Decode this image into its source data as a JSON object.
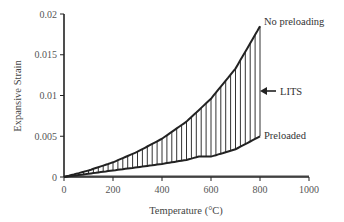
{
  "chart_data": {
    "type": "area",
    "title": "",
    "xlabel": "Temperature (°C)",
    "ylabel": "Expansive Strain",
    "xlim": [
      0,
      1000
    ],
    "ylim": [
      0,
      0.02
    ],
    "x_ticks": [
      "0",
      "200",
      "400",
      "600",
      "800",
      "1000"
    ],
    "y_ticks": [
      "0",
      "0.005",
      "0.01",
      "0.015",
      "0.02"
    ],
    "grid": false,
    "legend": "none (direct labels)",
    "series": [
      {
        "name": "No preloading",
        "x": [
          0,
          100,
          200,
          300,
          400,
          500,
          600,
          700,
          800
        ],
        "values": [
          0,
          0.0008,
          0.0018,
          0.0031,
          0.0047,
          0.0068,
          0.0096,
          0.0133,
          0.0185
        ]
      },
      {
        "name": "Preloaded",
        "x": [
          0,
          100,
          200,
          300,
          400,
          500,
          550,
          600,
          700,
          800
        ],
        "values": [
          0,
          0.0004,
          0.0008,
          0.0012,
          0.0016,
          0.0021,
          0.0025,
          0.0025,
          0.0034,
          0.005
        ]
      }
    ],
    "annotations": [
      {
        "text": "No preloading",
        "at": [
          800,
          0.0185
        ]
      },
      {
        "text": "Preloaded",
        "at": [
          800,
          0.005
        ]
      },
      {
        "text": "LITS",
        "arrow_to": [
          800,
          0.0105
        ],
        "meaning": "hatched region between curves"
      }
    ]
  },
  "labels": {
    "xlabel": "Temperature (°C)",
    "ylabel": "Expansive Strain",
    "no_preloading": "No preloading",
    "preloaded": "Preloaded",
    "lits": "LITS",
    "x_ticks": [
      "0",
      "200",
      "400",
      "600",
      "800",
      "1000"
    ],
    "y_ticks": [
      "0",
      "0.005",
      "0.01",
      "0.015",
      "0.02"
    ]
  }
}
